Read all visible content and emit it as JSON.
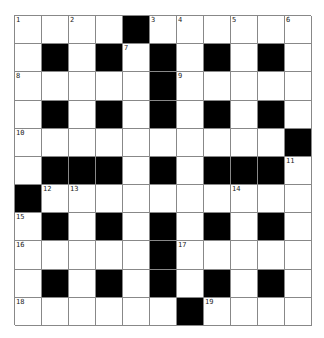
{
  "puzzle": {
    "rows": 11,
    "cols": 11,
    "colors": {
      "block": "#000000",
      "cell": "#ffffff",
      "gridline": "#888888"
    },
    "grid": [
      "..A.#......",
      ".#.#.#.#.#.",
      ".....#.....",
      ".#.#.#.#.#.",
      "..........#",
      ".###.#.###.",
      "#..........",
      ".#.#.#.#.#.",
      ".....#.....",
      ".#.#.#.#.#.",
      "......#...."
    ],
    "numbers": [
      {
        "row": 0,
        "col": 0,
        "n": "1"
      },
      {
        "row": 0,
        "col": 2,
        "n": "2"
      },
      {
        "row": 0,
        "col": 5,
        "n": "3"
      },
      {
        "row": 0,
        "col": 6,
        "n": "4"
      },
      {
        "row": 0,
        "col": 8,
        "n": "5"
      },
      {
        "row": 0,
        "col": 10,
        "n": "6"
      },
      {
        "row": 1,
        "col": 4,
        "n": "7"
      },
      {
        "row": 2,
        "col": 0,
        "n": "8"
      },
      {
        "row": 2,
        "col": 6,
        "n": "9"
      },
      {
        "row": 4,
        "col": 0,
        "n": "10"
      },
      {
        "row": 5,
        "col": 10,
        "n": "11"
      },
      {
        "row": 6,
        "col": 1,
        "n": "12"
      },
      {
        "row": 6,
        "col": 2,
        "n": "13"
      },
      {
        "row": 6,
        "col": 8,
        "n": "14"
      },
      {
        "row": 7,
        "col": 0,
        "n": "15"
      },
      {
        "row": 8,
        "col": 0,
        "n": "16"
      },
      {
        "row": 8,
        "col": 6,
        "n": "17"
      },
      {
        "row": 10,
        "col": 0,
        "n": "18"
      },
      {
        "row": 10,
        "col": 7,
        "n": "19"
      }
    ]
  }
}
